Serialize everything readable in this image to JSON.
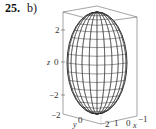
{
  "figure": {
    "problem_number": "25.",
    "part_label": "b)",
    "surface": "ellipsoid",
    "axes": {
      "z": {
        "name": "z",
        "ticks": [
          "2",
          "0",
          "−2"
        ]
      },
      "y": {
        "name": "y",
        "ticks": [
          "−2",
          "0",
          "2"
        ]
      },
      "x": {
        "name": "x",
        "ticks": [
          "1",
          "0",
          "−1"
        ]
      }
    }
  }
}
